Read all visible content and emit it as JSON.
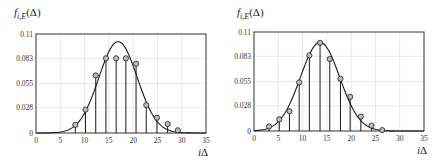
{
  "chart_data": [
    {
      "type": "line",
      "title": "",
      "ylabel": {
        "f": "f",
        "sub": "i,E",
        "arg": "(Δ)"
      },
      "xlabel": {
        "i": "i",
        "delta": "Δ"
      },
      "xlim": [
        0,
        35
      ],
      "ylim": [
        0,
        0.11
      ],
      "xticks": [
        0,
        5,
        10,
        15,
        20,
        25,
        30,
        35
      ],
      "yticks": [
        0,
        0.028,
        0.055,
        0.083,
        0.11
      ],
      "ytick_labels": [
        "0",
        "0.028",
        "0.055",
        "0.083",
        "0.11"
      ],
      "grid": true,
      "series": [
        {
          "name": "empirical (stems)",
          "kind": "stem",
          "x": [
            8.1,
            10.2,
            12.3,
            14.4,
            16.5,
            18.5,
            20.6,
            22.7,
            24.9,
            27.1,
            29.2
          ],
          "y": [
            0.009,
            0.026,
            0.064,
            0.083,
            0.083,
            0.083,
            0.077,
            0.031,
            0.017,
            0.01,
            0.003
          ]
        },
        {
          "name": "fitted density",
          "kind": "curve",
          "mean": 16.9,
          "sd": 3.95,
          "peak": 0.1015
        }
      ]
    },
    {
      "type": "line",
      "title": "",
      "ylabel": {
        "f": "f",
        "sub": "i,E",
        "arg": "(Δ)"
      },
      "xlabel": {
        "i": "i",
        "delta": "Δ"
      },
      "xlim": [
        0,
        35
      ],
      "ylim": [
        0,
        0.11
      ],
      "xticks": [
        0,
        5,
        10,
        15,
        20,
        25,
        30,
        35
      ],
      "yticks": [
        0,
        0.028,
        0.055,
        0.083,
        0.11
      ],
      "ytick_labels": [
        "0",
        "0.028",
        "0.055",
        "0.083",
        "0.11"
      ],
      "grid": true,
      "series": [
        {
          "name": "empirical (stems)",
          "kind": "stem",
          "x": [
            3.1,
            5.2,
            7.3,
            9.3,
            11.4,
            13.6,
            15.6,
            17.8,
            19.8,
            22.0,
            24.2,
            26.4
          ],
          "y": [
            0.005,
            0.013,
            0.022,
            0.054,
            0.084,
            0.098,
            0.08,
            0.058,
            0.038,
            0.016,
            0.006,
            0.001
          ]
        },
        {
          "name": "fitted density",
          "kind": "curve",
          "mean": 13.6,
          "sd": 4.05,
          "peak": 0.0985
        }
      ]
    }
  ],
  "colors": {
    "line": "#1a1a1a",
    "grid": "#e2e2e2",
    "frame": "#333333",
    "marker_fill": "#bdbdbd"
  }
}
